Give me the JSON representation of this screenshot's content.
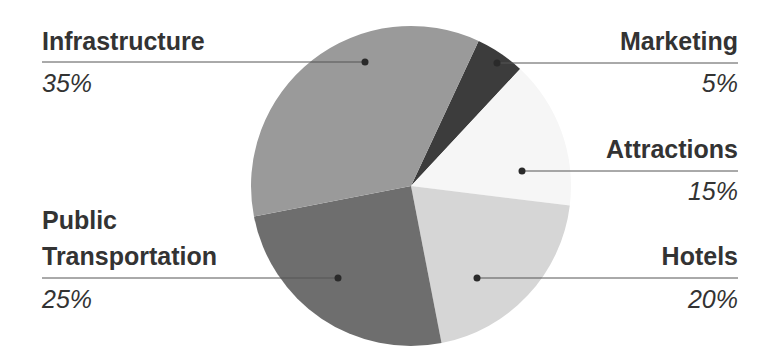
{
  "chart_data": {
    "type": "pie",
    "title": "",
    "center": [
      411,
      186
    ],
    "radius": 160,
    "start_angle_deg": 25,
    "slices": [
      {
        "name": "Marketing",
        "value": 5,
        "label": "5%",
        "color": "#3c3c3c",
        "side": "right",
        "dot": [
          497,
          63
        ],
        "line_y": 63,
        "label_top": 26,
        "pct_top": 68
      },
      {
        "name": "Attractions",
        "value": 15,
        "label": "15%",
        "color": "#f6f6f6",
        "side": "right",
        "dot": [
          522,
          171
        ],
        "line_y": 171,
        "label_top": 134,
        "pct_top": 176
      },
      {
        "name": "Hotels",
        "value": 20,
        "label": "20%",
        "color": "#d6d6d6",
        "side": "right",
        "dot": [
          477,
          278
        ],
        "line_y": 278,
        "label_top": 241,
        "pct_top": 284
      },
      {
        "name": "Public Transportation",
        "value": 25,
        "label": "25%",
        "color": "#6e6e6e",
        "side": "left",
        "dot": [
          338,
          278
        ],
        "line_y": 278,
        "label_top": 205,
        "pct_top": 284
      },
      {
        "name": "Infrastructure",
        "value": 35,
        "label": "35%",
        "color": "#9a9a9a",
        "side": "left",
        "dot": [
          365,
          62
        ],
        "line_y": 62,
        "label_top": 26,
        "pct_top": 68
      }
    ],
    "legend": "none",
    "annotations": "leader lines from slice dots to labels"
  },
  "labels": {
    "infrastructure": {
      "name": "Infrastructure",
      "pct": "35%"
    },
    "marketing": {
      "name": "Marketing",
      "pct": "5%"
    },
    "attractions": {
      "name": "Attractions",
      "pct": "15%"
    },
    "public_transportation": {
      "name_line1": "Public",
      "name_line2": "Transportation",
      "pct": "25%"
    },
    "hotels": {
      "name": "Hotels",
      "pct": "20%"
    }
  },
  "colors": {
    "text": "#333333",
    "leader_line": "#555555",
    "dot": "#2a2a2a"
  }
}
